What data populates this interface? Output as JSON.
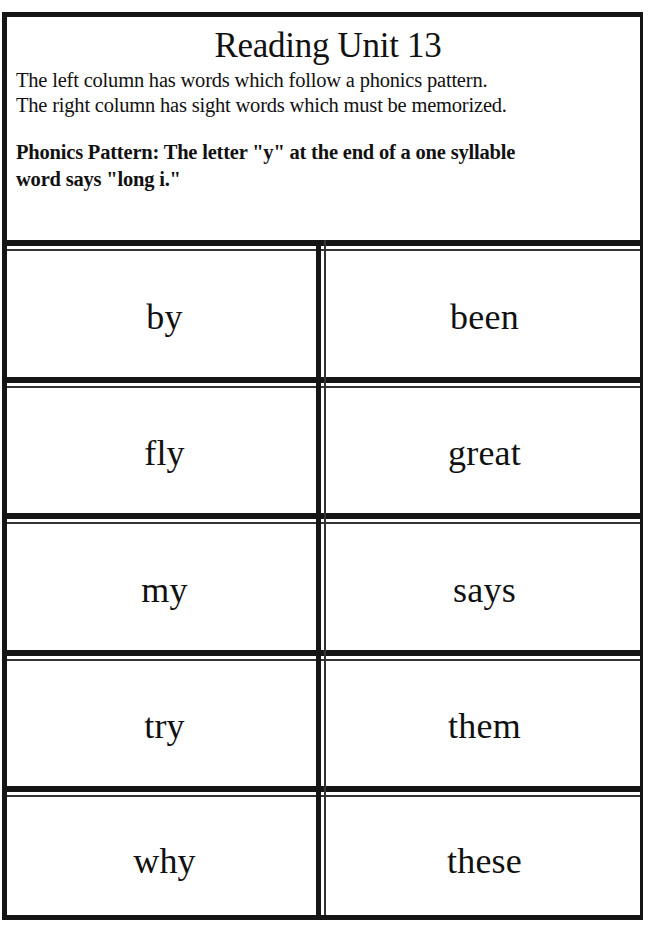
{
  "header": {
    "title": "Reading Unit 13",
    "intro_line_1": "The left column has words which follow a phonics pattern.",
    "intro_line_2": "The right column has sight words which must be memorized.",
    "pattern_line_1": "Phonics Pattern:  The letter \"y\" at the end of a one syllable",
    "pattern_line_2": "word says \"long i.\""
  },
  "columns": {
    "left_description": "phonics pattern words",
    "right_description": "sight words"
  },
  "rows": [
    {
      "phonics": "by",
      "sight": "been"
    },
    {
      "phonics": "fly",
      "sight": "great"
    },
    {
      "phonics": "my",
      "sight": "says"
    },
    {
      "phonics": "try",
      "sight": "them"
    },
    {
      "phonics": "why",
      "sight": "these"
    }
  ],
  "colors": {
    "ink": "#151515",
    "paper": "#ffffff"
  }
}
